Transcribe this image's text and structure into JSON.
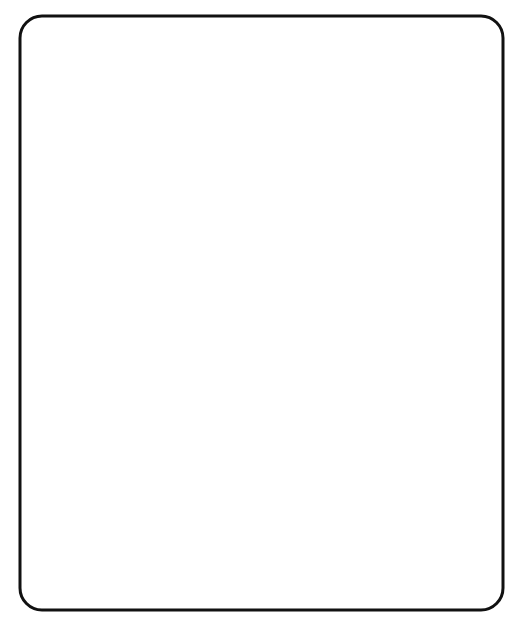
{
  "figure": {
    "panels": [
      {
        "id": "driven-contention",
        "title_lines": [
          "Driven Contention",
          "during Scan Shifting"
        ],
        "signal_label": "t_seB",
        "note": "Provide a Forced Mutual Exclusivity",
        "flops": [
          {
            "pins": [
              "D",
              "Q",
              "CLK"
            ]
          },
          {
            "pins": [
              "D",
              "Q",
              "CLK"
            ]
          },
          {
            "pins": [
              "Q",
              "D",
              "CLK"
            ]
          },
          {
            "pins": [
              "Q",
              "D",
              "CLK"
            ]
          }
        ]
      },
      {
        "id": "async-sync-priority",
        "title_lines": [
          "Asynchronous or Synchronous",
          "Signals with Higher Priority",
          "than Scan—or Non-Scan Elements"
        ],
        "signal_label": "f_seB",
        "note": "Provide a Blocking Signal",
        "flop_pins": {
          "d": "D",
          "q": "Q",
          "hold": "HOLD",
          "set": "SET",
          "clr": "CLR",
          "clk": "CLK"
        }
      },
      {
        "id": "gated-clock-nets",
        "title_lines": [
          "Gated Clock Nets"
        ],
        "signal_label": "f_seB",
        "note": "Provide a Blocking Signal"
      }
    ],
    "colors": {
      "line": "#222222",
      "note": "#777777",
      "gray_wire": "#999999",
      "dot_gray": "#666666"
    }
  }
}
